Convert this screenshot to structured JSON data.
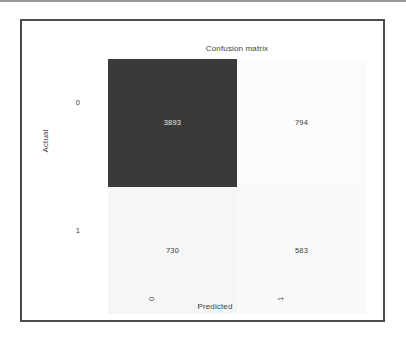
{
  "figure": {
    "title": "Confusion matrix",
    "xlabel": "Predicted",
    "ylabel": "Actual",
    "xticks": [
      "0",
      "1"
    ],
    "yticks": [
      "0",
      "1"
    ]
  },
  "cells": {
    "tn": "3893",
    "fp": "794",
    "fn": "730",
    "tp": "583"
  },
  "colors": {
    "dark_cell": "#3a3a3a",
    "light_cell_a": "#fbfbfb",
    "light_cell_b": "#f7f7f7",
    "light_cell_c": "#f4f4f4",
    "dark_text": "#3d3d3d",
    "light_text": "#e9e9e9",
    "frame": "#4b4b4b"
  },
  "chart_data": {
    "type": "heatmap",
    "title": "Confusion matrix",
    "xlabel": "Predicted",
    "ylabel": "Actual",
    "categories_x": [
      "0",
      "1"
    ],
    "categories_y": [
      "0",
      "1"
    ],
    "values": [
      [
        3893,
        794
      ],
      [
        730,
        583
      ]
    ],
    "annotations": [
      [
        "3893",
        "794"
      ],
      [
        "730",
        "583"
      ]
    ],
    "cmap": "greys",
    "vmin": 583,
    "vmax": 3893,
    "grid": false,
    "legend": "none",
    "colorbar": false
  }
}
